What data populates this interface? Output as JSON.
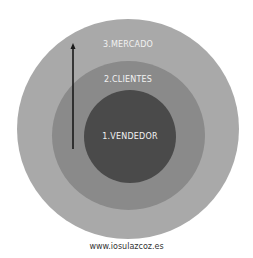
{
  "diagram": {
    "type": "concentric-circles",
    "rings": [
      {
        "id": "outer",
        "label": "3.MERCADO",
        "color": "#a9a9a9"
      },
      {
        "id": "middle",
        "label": "2.CLIENTES",
        "color": "#8a8a8a"
      },
      {
        "id": "inner",
        "label": "1.VENDEDOR",
        "color": "#4a4a4a"
      }
    ],
    "arrow": {
      "direction": "up",
      "color": "#1a1a1a"
    }
  },
  "footer": {
    "url": "www.iosulazcoz.es"
  }
}
